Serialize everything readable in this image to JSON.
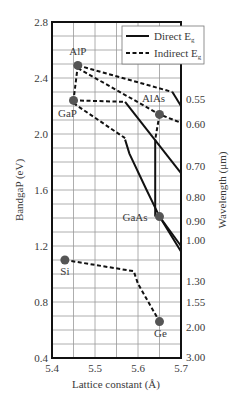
{
  "chart_data": {
    "type": "scatter",
    "title": "",
    "xlabel": "Lattice constant (Å)",
    "ylabel": "BandgaP (eV)",
    "y2label": "Wavelength (μm)",
    "xlim": [
      5.4,
      5.7
    ],
    "ylim": [
      0.4,
      2.8
    ],
    "grid": true,
    "x_ticks": [
      "5.4",
      "5.5",
      "5.6",
      "5.7"
    ],
    "y_ticks": [
      "2.8",
      "2.4",
      "2.0",
      "1.6",
      "1.2",
      "0.8",
      "0.4"
    ],
    "y2_ticks": [
      {
        "label": "0.55",
        "ev": 2.25
      },
      {
        "label": "0.60",
        "ev": 2.07
      },
      {
        "label": "0.70",
        "ev": 1.77
      },
      {
        "label": "0.80",
        "ev": 1.55
      },
      {
        "label": "0.90",
        "ev": 1.38
      },
      {
        "label": "1.00",
        "ev": 1.24
      },
      {
        "label": "1.30",
        "ev": 0.95
      },
      {
        "label": "1.55",
        "ev": 0.8
      },
      {
        "label": "2.00",
        "ev": 0.62
      },
      {
        "label": "3.00",
        "ev": 0.41
      }
    ],
    "legend": {
      "position": "upper right",
      "entries": [
        {
          "label": "Direct E",
          "subscript": "g",
          "style": "solid"
        },
        {
          "label": "Indirect E",
          "subscript": "g",
          "style": "dashed"
        }
      ]
    },
    "points": [
      {
        "name": "AlP",
        "x": 5.46,
        "y": 2.49
      },
      {
        "name": "GaP",
        "x": 5.45,
        "y": 2.24
      },
      {
        "name": "AlAs",
        "x": 5.65,
        "y": 2.14
      },
      {
        "name": "GaAs",
        "x": 5.65,
        "y": 1.41
      },
      {
        "name": "Si",
        "x": 5.43,
        "y": 1.1
      },
      {
        "name": "Ge",
        "x": 5.65,
        "y": 0.66
      }
    ],
    "series": [
      {
        "name": "AlP-GaP",
        "style": "dashed",
        "points": [
          [
            5.46,
            2.49
          ],
          [
            5.45,
            2.24
          ]
        ]
      },
      {
        "name": "AlP upper indirect",
        "style": "dashed",
        "points": [
          [
            5.46,
            2.49
          ],
          [
            5.68,
            2.3
          ]
        ]
      },
      {
        "name": "AlP upper direct",
        "style": "solid",
        "points": [
          [
            5.68,
            2.3
          ],
          [
            5.7,
            2.2
          ]
        ]
      },
      {
        "name": "AlP-AlAs indirect",
        "style": "dashed",
        "points": [
          [
            5.46,
            2.47
          ],
          [
            5.65,
            2.14
          ],
          [
            5.7,
            2.08
          ]
        ]
      },
      {
        "name": "GaP flat indirect",
        "style": "dashed",
        "points": [
          [
            5.45,
            2.24
          ],
          [
            5.57,
            2.23
          ]
        ]
      },
      {
        "name": "GaP flat direct",
        "style": "solid",
        "points": [
          [
            5.57,
            2.23
          ],
          [
            5.7,
            1.72
          ]
        ]
      },
      {
        "name": "GaP lower indirect",
        "style": "dashed",
        "points": [
          [
            5.45,
            2.22
          ],
          [
            5.57,
            1.97
          ]
        ]
      },
      {
        "name": "GaP-GaAs direct",
        "style": "solid",
        "points": [
          [
            5.57,
            1.96
          ],
          [
            5.58,
            1.86
          ],
          [
            5.62,
            1.6
          ],
          [
            5.65,
            1.41
          ],
          [
            5.7,
            1.16
          ]
        ]
      },
      {
        "name": "GaAs-upper direct",
        "style": "solid",
        "points": [
          [
            5.65,
            1.41
          ],
          [
            5.7,
            1.2
          ]
        ]
      },
      {
        "name": "AlAs-GaAs indirect",
        "style": "dashed",
        "points": [
          [
            5.65,
            2.14
          ],
          [
            5.64,
            1.96
          ]
        ]
      },
      {
        "name": "AlAs-GaAs direct",
        "style": "solid",
        "points": [
          [
            5.64,
            1.96
          ],
          [
            5.64,
            1.41
          ]
        ]
      },
      {
        "name": "Si-Ge indirect",
        "style": "dashed",
        "points": [
          [
            5.43,
            1.1
          ],
          [
            5.59,
            1.02
          ],
          [
            5.6,
            0.93
          ],
          [
            5.65,
            0.66
          ]
        ]
      }
    ]
  }
}
